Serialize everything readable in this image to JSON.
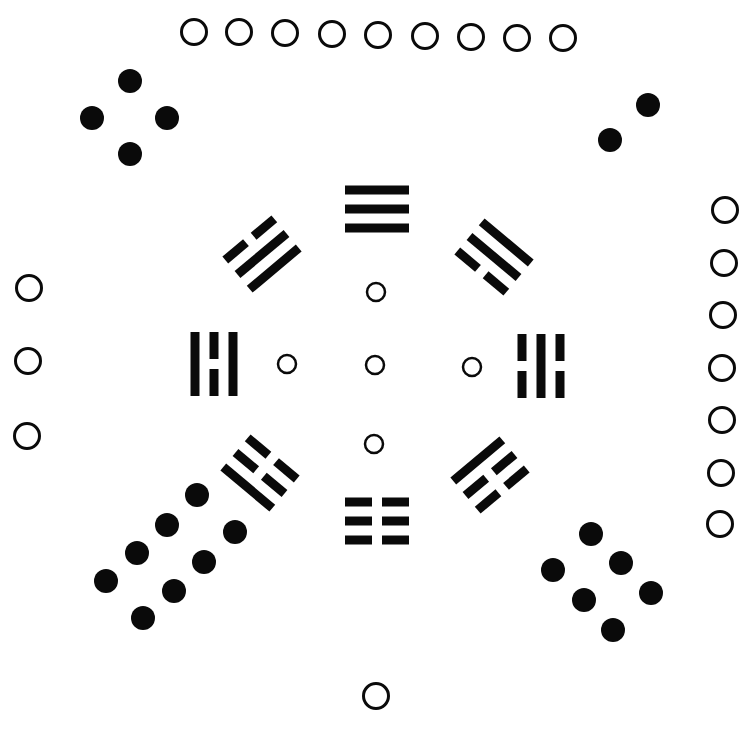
{
  "diagram": {
    "title": "",
    "colors": {
      "ink": "#0a0a0a",
      "background": "#ffffff"
    },
    "dot_radius": 12,
    "ring_radius_large": 14,
    "ring_radius_small": 9,
    "ring_stroke": 3,
    "center_rings": [
      {
        "cx": 376,
        "cy": 292
      },
      {
        "cx": 287,
        "cy": 364
      },
      {
        "cx": 375,
        "cy": 365
      },
      {
        "cx": 472,
        "cy": 367
      },
      {
        "cx": 374,
        "cy": 444
      }
    ],
    "number_groups": [
      {
        "name": "top-group-nine-white",
        "kind": "white",
        "points": [
          [
            194,
            32
          ],
          [
            239,
            32
          ],
          [
            285,
            33
          ],
          [
            332,
            34
          ],
          [
            378,
            35
          ],
          [
            425,
            36
          ],
          [
            471,
            37
          ],
          [
            517,
            38
          ],
          [
            563,
            38
          ]
        ]
      },
      {
        "name": "top-left-group-four-black",
        "kind": "black",
        "points": [
          [
            130,
            81
          ],
          [
            92,
            118
          ],
          [
            167,
            118
          ],
          [
            130,
            154
          ]
        ]
      },
      {
        "name": "top-right-group-two-black",
        "kind": "black",
        "points": [
          [
            648,
            105
          ],
          [
            610,
            140
          ]
        ]
      },
      {
        "name": "right-group-seven-white",
        "kind": "white",
        "points": [
          [
            725,
            210
          ],
          [
            724,
            263
          ],
          [
            723,
            315
          ],
          [
            722,
            368
          ],
          [
            722,
            420
          ],
          [
            721,
            473
          ],
          [
            720,
            524
          ]
        ]
      },
      {
        "name": "left-group-three-white",
        "kind": "white",
        "points": [
          [
            29,
            288
          ],
          [
            28,
            361
          ],
          [
            27,
            436
          ]
        ]
      },
      {
        "name": "bottom-left-group-eight-black",
        "kind": "black",
        "points": [
          [
            197,
            495
          ],
          [
            167,
            525
          ],
          [
            137,
            553
          ],
          [
            106,
            581
          ],
          [
            235,
            532
          ],
          [
            204,
            562
          ],
          [
            174,
            591
          ],
          [
            143,
            618
          ]
        ]
      },
      {
        "name": "bottom-right-group-six-black",
        "kind": "black",
        "points": [
          [
            591,
            534
          ],
          [
            553,
            570
          ],
          [
            621,
            563
          ],
          [
            584,
            600
          ],
          [
            651,
            593
          ],
          [
            613,
            630
          ]
        ]
      },
      {
        "name": "bottom-group-one-white",
        "kind": "white",
        "points": [
          [
            376,
            696
          ]
        ]
      }
    ],
    "trigrams": [
      {
        "name": "trigram-top-qian",
        "symbol": "☰",
        "cx": 377,
        "cy": 209,
        "angle": 0,
        "lines": [
          "solid",
          "solid",
          "solid"
        ]
      },
      {
        "name": "trigram-bottom-kun",
        "symbol": "☷",
        "cx": 377,
        "cy": 521,
        "angle": 0,
        "lines": [
          "broken",
          "broken",
          "broken"
        ]
      },
      {
        "name": "trigram-left-li",
        "symbol": "☲",
        "cx": 214,
        "cy": 364,
        "angle": 90,
        "lines": [
          "solid",
          "broken",
          "solid"
        ]
      },
      {
        "name": "trigram-right-kan",
        "symbol": "☵",
        "cx": 541,
        "cy": 366,
        "angle": 90,
        "lines": [
          "broken",
          "solid",
          "broken"
        ]
      },
      {
        "name": "trigram-top-left-xun",
        "symbol": "☴",
        "cx": 262,
        "cy": 254,
        "angle": -40,
        "lines": [
          "broken",
          "solid",
          "solid"
        ]
      },
      {
        "name": "trigram-top-right-dui",
        "symbol": "☱",
        "cx": 494,
        "cy": 257,
        "angle": 40,
        "lines": [
          "broken",
          "solid",
          "solid"
        ],
        "flip": true
      },
      {
        "name": "trigram-bottom-left-gen",
        "symbol": "☶",
        "cx": 260,
        "cy": 473,
        "angle": 40,
        "lines": [
          "broken",
          "broken",
          "solid"
        ]
      },
      {
        "name": "trigram-bottom-right-zhen",
        "symbol": "☳",
        "cx": 490,
        "cy": 475,
        "angle": -40,
        "lines": [
          "solid",
          "broken",
          "broken"
        ]
      }
    ]
  }
}
